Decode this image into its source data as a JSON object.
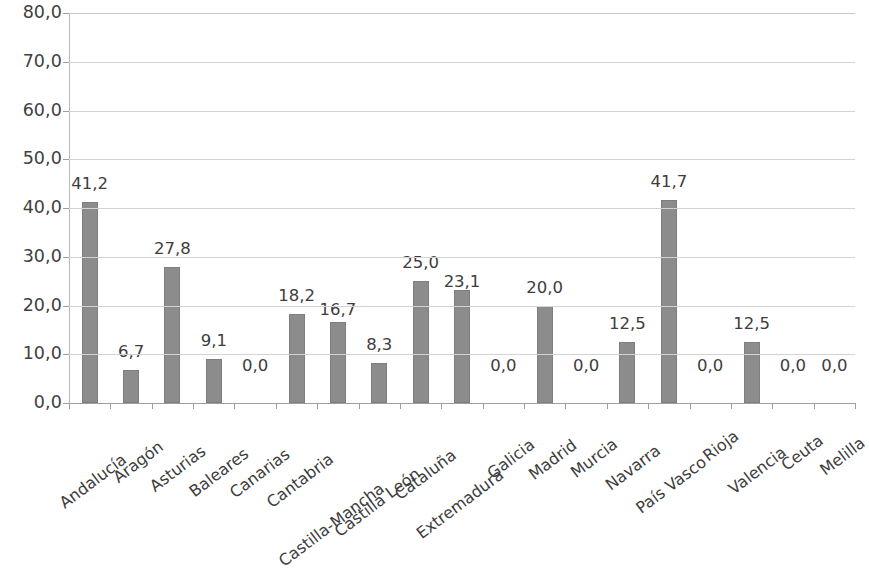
{
  "chart_data": {
    "type": "bar",
    "title": "",
    "subtitle": "",
    "xlabel": "",
    "ylabel": "",
    "ylim": [
      0,
      80
    ],
    "y_tick_step": 10,
    "grid": true,
    "legend": false,
    "legend_position": "none",
    "decimal_separator": ",",
    "bar_color": "#8c8c8c",
    "gridline_color": "#d3d3d3",
    "axis_color": "#9e9e9e",
    "background_color": "#ffffff",
    "y_tick_labels": [
      "80,0",
      "70,0",
      "60,0",
      "50,0",
      "40,0",
      "30,0",
      "20,0",
      "10,0",
      "0,0"
    ],
    "y_tick_values": [
      80,
      70,
      60,
      50,
      40,
      30,
      20,
      10,
      0
    ],
    "categories": [
      "Andalucía",
      "Aragón",
      "Asturias",
      "Baleares",
      "Canarias",
      "Cantabria",
      "Castilla-Mancha",
      "Castilla León",
      "Cataluña",
      "Extremadura",
      "Galicia",
      "Madrid",
      "Murcia",
      "Navarra",
      "País Vasco",
      "Rioja",
      "Valencia",
      "Ceuta",
      "Melilla"
    ],
    "values": [
      41.2,
      6.7,
      27.8,
      9.1,
      0.0,
      18.2,
      16.7,
      8.3,
      25.0,
      23.1,
      0.0,
      20.0,
      0.0,
      12.5,
      41.7,
      0.0,
      12.5,
      0.0,
      0.0
    ],
    "value_labels": [
      "41,2",
      "6,7",
      "27,8",
      "9,1",
      "0,0",
      "18,2",
      "16,7",
      "8,3",
      "25,0",
      "23,1",
      "0,0",
      "20,0",
      "0,0",
      "12,5",
      "41,7",
      "0,0",
      "12,5",
      "0,0",
      "0,0"
    ]
  }
}
